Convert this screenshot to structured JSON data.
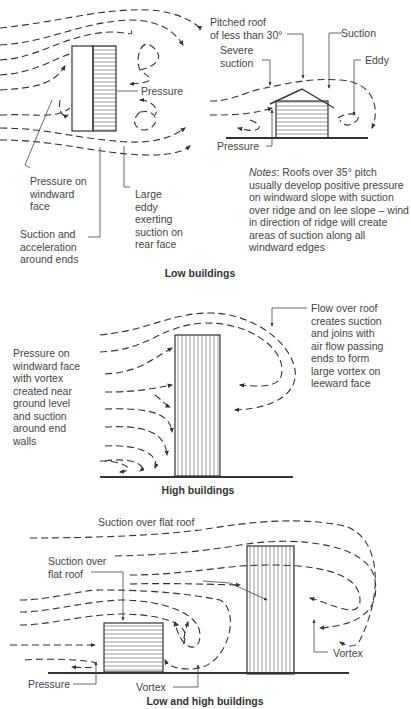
{
  "figure": {
    "sections": [
      {
        "caption": "Low buildings",
        "plan_labels": {
          "pressure": "Pressure",
          "pressure_windward": "Pressure on\nwindward\nface",
          "large_eddy": "Large\neddy\nexerting\nsuction on\nrear face",
          "suction_ends": "Suction and\nacceleration\naround ends"
        },
        "section_labels": {
          "pitched_roof": "Pitched roof\nof less than 30°",
          "suction": "Suction",
          "severe_suction": "Severe\nsuction",
          "eddy": "Eddy",
          "pressure": "Pressure"
        },
        "notes": {
          "prefix": "Notes",
          "text": ": Roofs over 35° pitch usually develop positive pressure on windward slope with suction over ridge and on lee slope – wind in direction of ridge will create areas of suction along all windward edges"
        }
      },
      {
        "caption": "High buildings",
        "labels": {
          "pressure_windward": "Pressure on\nwindward face\nwith vortex\ncreated near\nground level\nand suction\naround end\nwalls",
          "flow_over_roof": "Flow over roof\ncreates suction\nand joins with\nair flow passing\nends to form\nlarge vortex on\nleeward face"
        }
      },
      {
        "caption": "Low and high buildings",
        "labels": {
          "suction_flat_roof_high": "Suction over flat roof",
          "suction_flat_roof_low": "Suction over\nflat roof",
          "vortex_right": "Vortex",
          "pressure": "Pressure",
          "vortex_bottom": "Vortex"
        }
      }
    ],
    "colors": {
      "line": "#333333",
      "text": "#444444"
    }
  }
}
